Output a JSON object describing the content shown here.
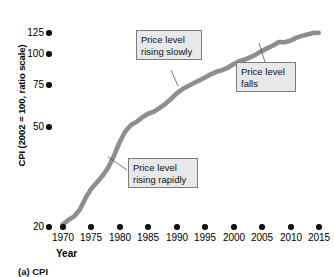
{
  "chart_data": {
    "type": "line",
    "title": "",
    "subtitle": "",
    "xlabel": "Year",
    "ylabel": "CPI (2002 = 100, ratio scale)",
    "scale": "log",
    "grid": false,
    "legend": "none",
    "xlim": [
      1969,
      2016
    ],
    "ylim": [
      20,
      135
    ],
    "xticks": [
      1970,
      1975,
      1980,
      1985,
      1990,
      1995,
      2000,
      2005,
      2010,
      2015
    ],
    "xtick_labels": [
      "1970",
      "1975",
      "1980",
      "1985",
      "1990",
      "1995",
      "2000",
      "2005",
      "2010",
      "2015"
    ],
    "yticks": [
      20,
      50,
      75,
      100,
      125
    ],
    "ytick_labels": [
      "20",
      "50",
      "75",
      "100",
      "125"
    ],
    "series": [
      {
        "name": "CPI",
        "color": "#8e8e8e",
        "x": [
          1970,
          1971,
          1972,
          1973,
          1974,
          1975,
          1976,
          1977,
          1978,
          1979,
          1980,
          1981,
          1982,
          1983,
          1984,
          1985,
          1986,
          1987,
          1988,
          1989,
          1990,
          1991,
          1992,
          1993,
          1994,
          1995,
          1996,
          1997,
          1998,
          1999,
          2000,
          2001,
          2002,
          2003,
          2004,
          2005,
          2006,
          2007,
          2008,
          2009,
          2010,
          2011,
          2012,
          2013,
          2014,
          2015
        ],
        "y": [
          20.4,
          21.3,
          22.0,
          23.4,
          26.0,
          28.3,
          30.0,
          31.9,
          34.4,
          38.3,
          43.4,
          47.9,
          50.9,
          52.5,
          54.8,
          56.7,
          57.8,
          59.9,
          62.3,
          65.3,
          68.9,
          71.8,
          74.0,
          76.1,
          78.1,
          80.3,
          82.7,
          84.6,
          85.9,
          87.8,
          90.7,
          93.3,
          94.8,
          96.9,
          99.5,
          102.9,
          106.2,
          109.2,
          113.4,
          113.0,
          114.9,
          118.5,
          121.0,
          122.8,
          124.8,
          125.0
        ],
        "values": [
          20.4,
          21.3,
          22.0,
          23.4,
          26.0,
          28.3,
          30.0,
          31.9,
          34.4,
          38.3,
          43.4,
          47.9,
          50.9,
          52.5,
          54.8,
          56.7,
          57.8,
          59.9,
          62.3,
          65.3,
          68.9,
          71.8,
          74.0,
          76.1,
          78.1,
          80.3,
          82.7,
          84.6,
          85.9,
          87.8,
          90.7,
          93.3,
          94.8,
          96.9,
          99.5,
          102.9,
          106.2,
          109.2,
          113.4,
          113.0,
          114.9,
          118.5,
          121.0,
          122.8,
          124.8,
          125.0
        ]
      }
    ],
    "annotations": [
      {
        "id": "rising-slowly",
        "text": "Price level\nrising slowly",
        "target_x": 1991,
        "target_y": 71
      },
      {
        "id": "falls",
        "text": "Price level\nfalls",
        "target_x": 2008,
        "target_y": 113
      },
      {
        "id": "rising-rapidly",
        "text": "Price level\nrising rapidly",
        "target_x": 1977,
        "target_y": 32
      }
    ]
  },
  "axes": {
    "y_title": "CPI (2002 = 100, ratio scale)",
    "x_title": "Year",
    "y_labels": [
      "125",
      "100",
      "75",
      "50",
      "20"
    ],
    "x_labels": [
      "1970",
      "1975",
      "1980",
      "1985",
      "1990",
      "1995",
      "2000",
      "2005",
      "2010",
      "2015"
    ]
  },
  "callouts": {
    "slowly": "Price level\nrising slowly",
    "falls": "Price level\nfalls",
    "rapidly": "Price level\nrising rapidly"
  },
  "caption": "(a) CPI",
  "colors": {
    "line": "#8e8e8e",
    "marker": "#111111",
    "callout_bg": "#e8e8e8",
    "callout_border": "#7c7c7c",
    "background": "#ffffff"
  }
}
